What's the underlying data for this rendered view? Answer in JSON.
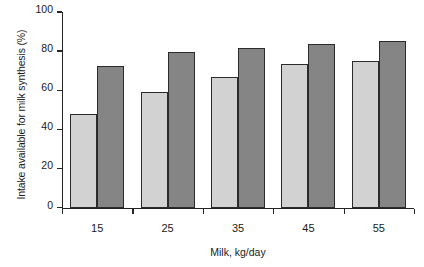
{
  "chart_data": {
    "type": "bar",
    "title": "",
    "subtitle": "",
    "xlabel": "Milk, kg/day",
    "ylabel": "Intake available for milk synthesis (%)",
    "categories": [
      "15",
      "25",
      "35",
      "45",
      "55"
    ],
    "series": [
      {
        "name": "light-series",
        "color": "#d2d2d2",
        "values": [
          48,
          59,
          67,
          73.5,
          75
        ]
      },
      {
        "name": "dark-series",
        "color": "#858585",
        "values": [
          72.5,
          79.5,
          81.5,
          83.5,
          85
        ]
      }
    ],
    "ylim": [
      0,
      100
    ],
    "y_ticks": [
      "0",
      "20",
      "40",
      "60",
      "80",
      "100"
    ],
    "y_tick_values": [
      0,
      20,
      40,
      60,
      80,
      100
    ],
    "grid": false,
    "legend": "none",
    "bar_border_color": "#2b2b2b",
    "axis_color": "#242424",
    "background": "#ffffff"
  }
}
